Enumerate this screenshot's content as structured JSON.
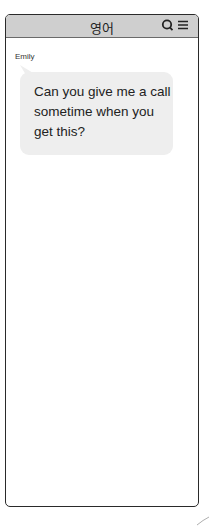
{
  "header": {
    "title": "영어",
    "icons": [
      "search-icon",
      "menu-icon"
    ]
  },
  "conversation": {
    "sender": "Emily",
    "messages": [
      {
        "text": "Can you give me a call sometime when you get this?"
      }
    ]
  },
  "colors": {
    "header_bg": "#cfcfcf",
    "bubble_bg": "#eeeeee",
    "frame_border": "#2a2a2a"
  }
}
